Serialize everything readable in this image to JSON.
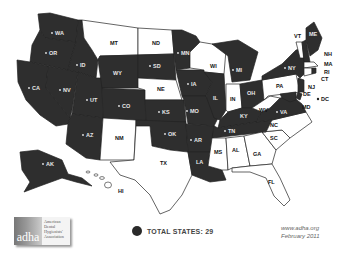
{
  "map": {
    "colors": {
      "shaded": "#2e2e2e",
      "unshaded": "#ffffff",
      "border": "#222222"
    },
    "shaded_states": [
      "WA",
      "OR",
      "CA",
      "NV",
      "ID",
      "UT",
      "AZ",
      "WY",
      "CO",
      "SD",
      "MN",
      "IA",
      "KS",
      "MO",
      "OK",
      "AR",
      "LA",
      "IL",
      "MI",
      "OH",
      "KY",
      "TN",
      "VA",
      "NY",
      "ME",
      "NH",
      "NJ",
      "MD",
      "AK"
    ],
    "unshaded_states": [
      "MT",
      "ND",
      "NE",
      "NM",
      "TX",
      "WI",
      "IN",
      "WV",
      "PA",
      "VT",
      "MA",
      "CT",
      "RI",
      "DE",
      "NC",
      "SC",
      "GA",
      "AL",
      "MS",
      "FL",
      "HI"
    ],
    "labels": {
      "WA": "WA",
      "OR": "OR",
      "CA": "CA",
      "NV": "NV",
      "ID": "ID",
      "UT": "UT",
      "AZ": "AZ",
      "MT": "MT",
      "WY": "WY",
      "CO": "CO",
      "NM": "NM",
      "ND": "ND",
      "SD": "SD",
      "NE": "NE",
      "KS": "KS",
      "OK": "OK",
      "TX": "TX",
      "MN": "MN",
      "IA": "IA",
      "MO": "MO",
      "AR": "AR",
      "LA": "LA",
      "WI": "WI",
      "IL": "IL",
      "MI": "MI",
      "IN": "IN",
      "OH": "OH",
      "KY": "KY",
      "TN": "TN",
      "MS": "MS",
      "AL": "AL",
      "GA": "GA",
      "FL": "FL",
      "SC": "SC",
      "NC": "NC",
      "VA": "VA",
      "WV": "WV",
      "PA": "PA",
      "NY": "NY",
      "VT": "VT",
      "NH": "NH",
      "ME": "ME",
      "MA": "MA",
      "RI": "RI",
      "CT": "CT",
      "NJ": "NJ",
      "DE": "DE",
      "MD": "MD",
      "DC": "DC",
      "AK": "AK",
      "HI": "HI"
    }
  },
  "legend": {
    "label": "TOTAL STATES:  29"
  },
  "credit": {
    "url": "www.adha.org",
    "date": "February 2011"
  },
  "logo": {
    "mark": "adha",
    "lines": [
      "American",
      "Dental",
      "Hygienists'",
      "Association"
    ]
  }
}
